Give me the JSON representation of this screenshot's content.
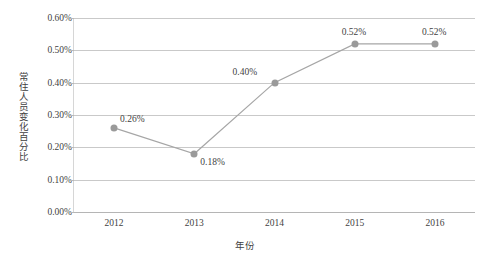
{
  "chart_data": {
    "type": "line",
    "title": "",
    "xlabel": "年份",
    "ylabel": "常住人员变化百分比",
    "categories": [
      "2012",
      "2013",
      "2014",
      "2015",
      "2016"
    ],
    "values": [
      0.26,
      0.18,
      0.4,
      0.52,
      0.52
    ],
    "value_labels": [
      "0.26%",
      "0.18%",
      "0.40%",
      "0.52%",
      "0.52%"
    ],
    "series": [
      {
        "name": "常住人员变化百分比",
        "values": [
          0.26,
          0.18,
          0.4,
          0.52,
          0.52
        ]
      }
    ],
    "ylim": [
      0.0,
      0.6
    ],
    "ytick_values": [
      0.6,
      0.5,
      0.4,
      0.3,
      0.2,
      0.1,
      0.0
    ],
    "ytick_labels": [
      "0.60%",
      "0.50%",
      "0.40%",
      "0.30%",
      "0.20%",
      "0.10%",
      "0.00%"
    ],
    "grid": "horizontal",
    "legend": "none",
    "line_color": "#a6a6a6",
    "marker_color": "#9a9a9a",
    "grid_color": "#c9c9c9",
    "text_color": "#3f3f3f",
    "background_color": "#ffffff",
    "label_offsets": [
      {
        "dx": 6,
        "dy": -14
      },
      {
        "dx": 6,
        "dy": 3
      },
      {
        "dx": -42,
        "dy": -16
      },
      {
        "dx": -13,
        "dy": -17
      },
      {
        "dx": -13,
        "dy": -17
      }
    ]
  }
}
